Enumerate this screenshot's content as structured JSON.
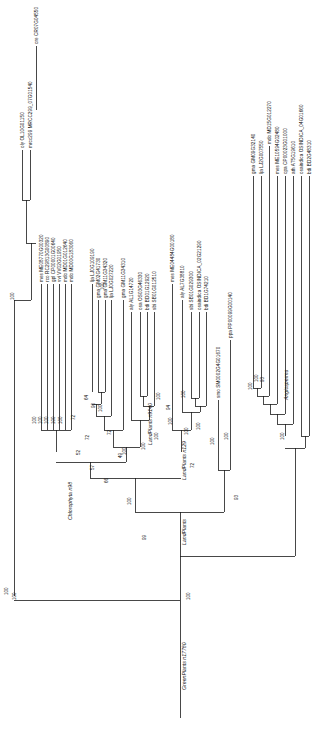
{
  "figure": {
    "type": "phylogenetic-tree",
    "orientation": "rotated-90-clockwise",
    "root_label": "GreenPlants n17780",
    "background": "#ffffff",
    "line_color": "#1a1a1a"
  },
  "clades": [
    {
      "name": "Chlorophyta n98",
      "x": 72,
      "y": 520
    },
    {
      "name": "LandPlants n9140",
      "x": 152,
      "y": 445
    },
    {
      "name": "LandPlants n129",
      "x": 186,
      "y": 480
    },
    {
      "name": "LandPlants",
      "x": 186,
      "y": 545
    },
    {
      "name": "Angiosperms",
      "x": 288,
      "y": 400
    },
    {
      "name": "GreenPlants n17780",
      "x": 186,
      "y": 690
    }
  ],
  "leaves": [
    {
      "id": "L1",
      "label": "cre CR07G04550",
      "x": 36,
      "tip_y": 46
    },
    {
      "id": "L2",
      "label": "oly OL10G01150",
      "x": 22,
      "tip_y": 150
    },
    {
      "id": "L3",
      "label": "mrcc299 MRCC299_07G01540",
      "x": 30,
      "tip_y": 150
    },
    {
      "id": "L4",
      "label": "mes ME08770G00320",
      "x": 41,
      "tip_y": 284
    },
    {
      "id": "L5",
      "label": "rco RC29813G00890",
      "x": 47,
      "tip_y": 284
    },
    {
      "id": "L6",
      "label": "gpl CP00001G00640",
      "x": 53,
      "tip_y": 284
    },
    {
      "id": "L7",
      "label": "vvi VV02G01950",
      "x": 59,
      "tip_y": 284
    },
    {
      "id": "L8",
      "label": "mdo MD01G012640",
      "x": 65,
      "tip_y": 284
    },
    {
      "id": "L9",
      "label": "mdo MD00G183060",
      "x": 71,
      "tip_y": 284
    },
    {
      "id": "L10",
      "label": "lja LJ0G109190",
      "x": 92,
      "tip_y": 284
    },
    {
      "id": "L11",
      "label": "gma GM02G41730",
      "x": 98,
      "tip_y": 300
    },
    {
      "id": "L12",
      "label": "gma GM11G34320",
      "x": 105,
      "tip_y": 300
    },
    {
      "id": "L13",
      "label": "lja LJ0G027220",
      "x": 111,
      "tip_y": 300
    },
    {
      "id": "L14",
      "label": "gma GM11G34310",
      "x": 123,
      "tip_y": 300
    },
    {
      "id": "L15",
      "label": "aly AL1G14720",
      "x": 131,
      "tip_y": 312
    },
    {
      "id": "L16",
      "label": "osa OS03G46330",
      "x": 140,
      "tip_y": 312
    },
    {
      "id": "L17",
      "label": "bdi BD01G12920",
      "x": 147,
      "tip_y": 312
    },
    {
      "id": "L18",
      "label": "sbi SB01G012510",
      "x": 154,
      "tip_y": 312
    },
    {
      "id": "L19",
      "label": "mes ME04484G00180",
      "x": 172,
      "tip_y": 284
    },
    {
      "id": "L20",
      "label": "aly AL7G38810",
      "x": 182,
      "tip_y": 300
    },
    {
      "id": "L21",
      "label": "sbi SB01G029300",
      "x": 191,
      "tip_y": 312
    },
    {
      "id": "L22",
      "label": "osaindica OSINDICA_02G21290",
      "x": 199,
      "tip_y": 312
    },
    {
      "id": "L23",
      "label": "bdi BD1G74210",
      "x": 206,
      "tip_y": 312
    },
    {
      "id": "L24",
      "label": "smo SM0002G4G01670",
      "x": 218,
      "tip_y": 400
    },
    {
      "id": "L25",
      "label": "ppa PP00099G00140",
      "x": 230,
      "tip_y": 340
    },
    {
      "id": "L26",
      "label": "gma GM09G32140",
      "x": 253,
      "tip_y": 176
    },
    {
      "id": "L27",
      "label": "lja LJ2G007550",
      "x": 261,
      "tip_y": 176
    },
    {
      "id": "L28",
      "label": "mdo MD15G012270",
      "x": 269,
      "tip_y": 146
    },
    {
      "id": "L29",
      "label": "mes ME10594G02480",
      "x": 277,
      "tip_y": 176
    },
    {
      "id": "L30",
      "label": "cpa CP00023G01000",
      "x": 285,
      "tip_y": 176
    },
    {
      "id": "L31",
      "label": "ath AT5G19610",
      "x": 293,
      "tip_y": 176
    },
    {
      "id": "L32",
      "label": "osaindica OSINDICA_04G01660",
      "x": 301,
      "tip_y": 176
    },
    {
      "id": "L33",
      "label": "bdi BD2G48310",
      "x": 309,
      "tip_y": 176
    }
  ],
  "bootstrap_values": [
    {
      "value": "100",
      "x": 14,
      "y": 300
    },
    {
      "value": "100",
      "x": 104,
      "y": 290
    },
    {
      "value": "100",
      "x": 8,
      "y": 595
    },
    {
      "value": "100",
      "x": 36,
      "y": 424
    },
    {
      "value": "100",
      "x": 42,
      "y": 424
    },
    {
      "value": "100",
      "x": 48,
      "y": 424
    },
    {
      "value": "100",
      "x": 55,
      "y": 424
    },
    {
      "value": "100",
      "x": 62,
      "y": 424
    },
    {
      "value": "64",
      "x": 88,
      "y": 400
    },
    {
      "value": "90",
      "x": 95,
      "y": 408
    },
    {
      "value": "100",
      "x": 102,
      "y": 412
    },
    {
      "value": "72",
      "x": 75,
      "y": 420
    },
    {
      "value": "72",
      "x": 89,
      "y": 440
    },
    {
      "value": "72",
      "x": 111,
      "y": 435
    },
    {
      "value": "49",
      "x": 122,
      "y": 458
    },
    {
      "value": "52",
      "x": 80,
      "y": 455
    },
    {
      "value": "57",
      "x": 94,
      "y": 470
    },
    {
      "value": "66",
      "x": 108,
      "y": 483
    },
    {
      "value": "100",
      "x": 126,
      "y": 455
    },
    {
      "value": "100",
      "x": 145,
      "y": 450
    },
    {
      "value": "100",
      "x": 158,
      "y": 440
    },
    {
      "value": "100",
      "x": 160,
      "y": 400
    },
    {
      "value": "100",
      "x": 172,
      "y": 425
    },
    {
      "value": "94",
      "x": 170,
      "y": 410
    },
    {
      "value": "100",
      "x": 185,
      "y": 398
    },
    {
      "value": "100",
      "x": 188,
      "y": 435
    },
    {
      "value": "72",
      "x": 194,
      "y": 468
    },
    {
      "value": "100",
      "x": 200,
      "y": 430
    },
    {
      "value": "100",
      "x": 214,
      "y": 445
    },
    {
      "value": "100",
      "x": 228,
      "y": 440
    },
    {
      "value": "93",
      "x": 238,
      "y": 500
    },
    {
      "value": "99",
      "x": 146,
      "y": 540
    },
    {
      "value": "100",
      "x": 131,
      "y": 505
    },
    {
      "value": "100",
      "x": 252,
      "y": 390
    },
    {
      "value": "100",
      "x": 258,
      "y": 382
    },
    {
      "value": "93",
      "x": 264,
      "y": 382
    },
    {
      "value": "100",
      "x": 284,
      "y": 440
    },
    {
      "value": "100",
      "x": 190,
      "y": 600
    },
    {
      "value": "100",
      "x": 16,
      "y": 600
    }
  ]
}
